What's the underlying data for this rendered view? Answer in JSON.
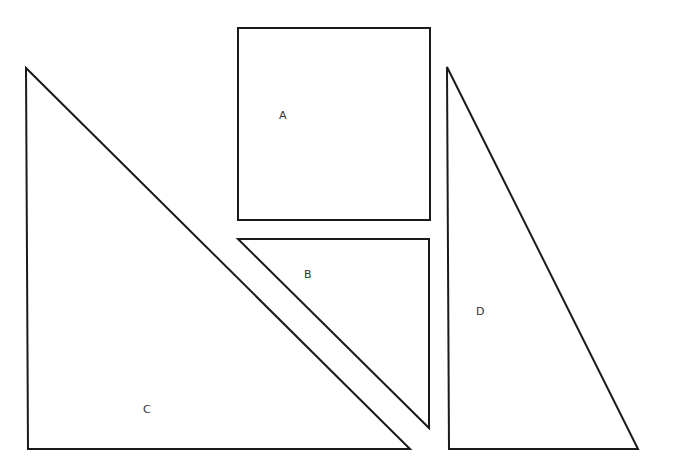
{
  "diagram": {
    "type": "geometric-shapes",
    "shapes": [
      {
        "id": "A",
        "kind": "square",
        "label": "A",
        "points": [
          [
            238,
            28
          ],
          [
            430,
            28
          ],
          [
            430,
            220
          ],
          [
            238,
            220
          ]
        ],
        "label_pos": [
          283,
          119
        ]
      },
      {
        "id": "B",
        "kind": "right-triangle",
        "label": "B",
        "points": [
          [
            238,
            239
          ],
          [
            429,
            239
          ],
          [
            429,
            428
          ]
        ],
        "label_pos": [
          308,
          277
        ]
      },
      {
        "id": "C",
        "kind": "right-triangle",
        "label": "C",
        "points": [
          [
            26,
            68
          ],
          [
            28,
            449
          ],
          [
            410,
            449
          ]
        ],
        "label_pos": [
          147,
          412
        ]
      },
      {
        "id": "D",
        "kind": "right-triangle",
        "label": "D",
        "points": [
          [
            447,
            67
          ],
          [
            449,
            449
          ],
          [
            638,
            449
          ]
        ],
        "label_pos": [
          480,
          314
        ]
      }
    ]
  }
}
